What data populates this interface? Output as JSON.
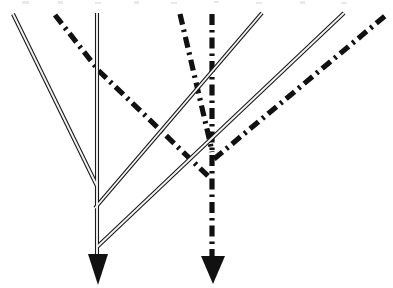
{
  "figure": {
    "background_color": "#ffffff",
    "ink_color": "#111111",
    "solid_line_fill": "#f4f4f4",
    "canvas": {
      "width": 393,
      "height": 288
    }
  },
  "styles": {
    "solid_outer_width": 4.1,
    "solid_inner_width": 1.9,
    "dashdot_width": 5.2,
    "dashdot_pattern": "11 5 2.5 5"
  },
  "chart_data": {
    "type": "line",
    "xlabel": "",
    "ylabel": "",
    "xlim": [
      0,
      393
    ],
    "ylim": [
      288,
      0
    ],
    "grid": false,
    "legend": "none",
    "series": [
      {
        "name": "solid-ray-left-descending",
        "style": "solid-double",
        "points": [
          [
            13,
            14
          ],
          [
            97,
            186
          ]
        ]
      },
      {
        "name": "solid-ray-vertical-axis",
        "style": "solid-double",
        "points": [
          [
            97,
            13
          ],
          [
            97,
            262
          ]
        ]
      },
      {
        "name": "solid-ray-inner-ascending",
        "style": "solid-double",
        "points": [
          [
            95,
            208
          ],
          [
            262,
            13
          ]
        ]
      },
      {
        "name": "solid-ray-outer-ascending",
        "style": "solid-double",
        "points": [
          [
            97,
            247
          ],
          [
            344,
            13
          ]
        ]
      },
      {
        "name": "dashdot-ray-upper-left",
        "style": "dash-dot",
        "points": [
          [
            55,
            15
          ],
          [
            99,
            71
          ],
          [
            208,
            176
          ]
        ]
      },
      {
        "name": "dashdot-ray-middle-slanted",
        "style": "dash-dot",
        "points": [
          [
            180,
            14
          ],
          [
            210,
            142
          ],
          [
            212,
            152
          ]
        ]
      },
      {
        "name": "dashdot-ray-vertical",
        "style": "dash-dot",
        "points": [
          [
            212,
            14
          ],
          [
            212,
            258
          ]
        ]
      },
      {
        "name": "dashdot-ray-right-ascending",
        "style": "dash-dot",
        "points": [
          [
            214,
            159
          ],
          [
            385,
            16
          ]
        ]
      }
    ],
    "arrowheads": [
      {
        "name": "arrowhead-left",
        "tip": [
          98,
          285
        ],
        "base_y": 254,
        "half_width": 10,
        "direction": "down"
      },
      {
        "name": "arrowhead-right",
        "tip": [
          213,
          284
        ],
        "base_y": 256,
        "half_width": 12,
        "direction": "down"
      }
    ]
  }
}
